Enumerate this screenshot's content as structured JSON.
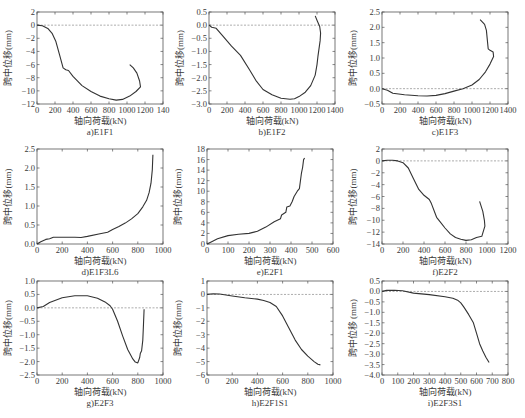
{
  "figure": {
    "ylabel": "跨中位移(mm)",
    "ylabel_alt": "跨中位移 (mm)",
    "xlabel": "轴向荷载(kN)"
  },
  "chart_data": [
    {
      "id": "a",
      "type": "line",
      "caption": "a)E1F1",
      "xlabel": "轴向荷载(kN)",
      "ylabel": "跨中位移(mm)",
      "xlim": [
        0,
        1400
      ],
      "ylim": [
        -12,
        2
      ],
      "xticks": [
        0,
        200,
        400,
        600,
        800,
        1000,
        1200,
        1400
      ],
      "xtick_labels": [
        "0",
        "200",
        "400",
        "600",
        "800",
        "1000",
        "1200",
        "140"
      ],
      "yticks": [
        2,
        0,
        -2,
        -4,
        -6,
        -8,
        -10,
        -12
      ],
      "zero_line": true,
      "box": [
        37,
        12,
        163,
        104
      ],
      "series": [
        {
          "name": "E1F1",
          "x": [
            0,
            60,
            120,
            170,
            210,
            250,
            290,
            320,
            350,
            400,
            500,
            600,
            700,
            800,
            880,
            950,
            1030,
            1100,
            1150,
            1140,
            1110,
            1070,
            1030
          ],
          "y": [
            0,
            -0.1,
            -0.5,
            -1.3,
            -2.5,
            -4.5,
            -6.5,
            -6.8,
            -6.9,
            -7.8,
            -9.2,
            -10.1,
            -10.8,
            -11.2,
            -11.4,
            -11.3,
            -10.8,
            -10.1,
            -9.4,
            -8.5,
            -7.3,
            -6.5,
            -6.0
          ]
        }
      ]
    },
    {
      "id": "b",
      "type": "line",
      "caption": "b)E1F2",
      "xlabel": "轴向荷载(kN)",
      "ylabel": "跨中位移(mm)",
      "xlim": [
        0,
        1400
      ],
      "ylim": [
        -3.0,
        0.5
      ],
      "xticks": [
        0,
        200,
        400,
        600,
        800,
        1000,
        1200,
        1400
      ],
      "xtick_labels": [
        "0",
        "200",
        "400",
        "600",
        "800",
        "1000",
        "1200",
        "1400"
      ],
      "yticks": [
        0.5,
        0.0,
        -0.5,
        -1.0,
        -1.5,
        -2.0,
        -2.5,
        -3.0
      ],
      "zero_line": true,
      "box": [
        209,
        12,
        335,
        104
      ],
      "series": [
        {
          "name": "E1F2",
          "x": [
            0,
            30,
            80,
            150,
            250,
            350,
            450,
            520,
            600,
            700,
            800,
            900,
            950,
            1000,
            1070,
            1130,
            1180,
            1200,
            1210,
            1235,
            1240,
            1230,
            1205,
            1180
          ],
          "y": [
            0,
            -0.08,
            -0.12,
            -0.4,
            -0.8,
            -1.15,
            -1.7,
            -2.1,
            -2.45,
            -2.65,
            -2.78,
            -2.82,
            -2.8,
            -2.72,
            -2.55,
            -2.3,
            -1.9,
            -1.5,
            -1.2,
            -0.6,
            -0.3,
            -0.05,
            0.15,
            0.35
          ]
        }
      ]
    },
    {
      "id": "c",
      "type": "line",
      "caption": "c)E1F3",
      "xlabel": "轴向荷载(kN)",
      "ylabel": "跨中位移(mm)",
      "xlim": [
        0,
        1400
      ],
      "ylim": [
        -0.5,
        2.5
      ],
      "xticks": [
        0,
        200,
        400,
        600,
        800,
        1000,
        1200,
        1400
      ],
      "xtick_labels": [
        "0",
        "200",
        "400",
        "600",
        "800",
        "1000",
        "1200",
        "1400"
      ],
      "yticks": [
        2.5,
        2.0,
        1.5,
        1.0,
        0.5,
        0.0,
        -0.5
      ],
      "zero_line": true,
      "box": [
        382,
        12,
        508,
        104
      ],
      "series": [
        {
          "name": "E1F3",
          "x": [
            0,
            60,
            120,
            250,
            400,
            500,
            600,
            700,
            800,
            900,
            1000,
            1080,
            1150,
            1200,
            1240,
            1235,
            1200,
            1180,
            1170,
            1160,
            1140,
            1090
          ],
          "y": [
            0,
            -0.05,
            -0.15,
            -0.2,
            -0.23,
            -0.24,
            -0.22,
            -0.16,
            -0.08,
            0.0,
            0.12,
            0.3,
            0.55,
            0.8,
            1.05,
            1.2,
            1.25,
            1.3,
            1.6,
            1.9,
            2.1,
            2.25
          ]
        }
      ]
    },
    {
      "id": "d",
      "type": "line",
      "caption": "d)E1F3L6",
      "xlabel": "轴向荷载(kN)",
      "ylabel": "跨中位移(mm)",
      "xlim": [
        0,
        1000
      ],
      "ylim": [
        0.0,
        2.5
      ],
      "xticks": [
        0,
        200,
        400,
        600,
        800,
        1000
      ],
      "xtick_labels": [
        "0",
        "200",
        "400",
        "600",
        "800",
        "1000"
      ],
      "yticks": [
        2.5,
        2.0,
        1.5,
        1.0,
        0.5,
        0.0
      ],
      "zero_line": false,
      "box": [
        37,
        149,
        163,
        244
      ],
      "series": [
        {
          "name": "E1F3L6",
          "x": [
            0,
            30,
            70,
            100,
            130,
            200,
            300,
            350,
            400,
            500,
            560,
            600,
            650,
            700,
            750,
            800,
            840,
            870,
            890,
            905,
            915,
            920
          ],
          "y": [
            0,
            0.06,
            0.12,
            0.14,
            0.18,
            0.18,
            0.18,
            0.17,
            0.2,
            0.27,
            0.31,
            0.38,
            0.46,
            0.55,
            0.66,
            0.8,
            0.98,
            1.15,
            1.35,
            1.6,
            1.95,
            2.35
          ]
        }
      ]
    },
    {
      "id": "e",
      "type": "line",
      "caption": "e)E2F1",
      "xlabel": "轴向荷载(kN)",
      "ylabel": "跨中位移(mm)",
      "xlim": [
        0,
        600
      ],
      "ylim": [
        0,
        18
      ],
      "xticks": [
        0,
        100,
        200,
        300,
        400,
        500,
        600
      ],
      "xtick_labels": [
        "0",
        "100",
        "200",
        "300",
        "400",
        "500",
        "600"
      ],
      "yticks": [
        18,
        16,
        14,
        12,
        10,
        8,
        6,
        4,
        2,
        0
      ],
      "zero_line": false,
      "box": [
        207,
        149,
        333,
        244
      ],
      "series": [
        {
          "name": "E2F1",
          "x": [
            0,
            20,
            50,
            100,
            150,
            200,
            240,
            280,
            320,
            350,
            355,
            375,
            380,
            395,
            405,
            415,
            430,
            440,
            450,
            455,
            460,
            465
          ],
          "y": [
            0,
            0.4,
            1.0,
            1.6,
            1.85,
            2.0,
            2.4,
            3.2,
            4.2,
            4.8,
            5.5,
            6.0,
            7.0,
            7.2,
            8.0,
            9.0,
            10.0,
            10.5,
            13.5,
            14.5,
            16.0,
            16.3
          ]
        }
      ]
    },
    {
      "id": "f",
      "type": "line",
      "caption": "f)E2F2",
      "xlabel": "轴向荷载(kN)",
      "ylabel": "跨中位移(mm)",
      "xlim": [
        0,
        1200
      ],
      "ylim": [
        -14,
        2
      ],
      "xticks": [
        0,
        200,
        400,
        600,
        800,
        1000,
        1200
      ],
      "xtick_labels": [
        "0",
        "200",
        "400",
        "600",
        "800",
        "1000",
        "1200"
      ],
      "yticks": [
        2,
        0,
        -2,
        -4,
        -6,
        -8,
        -10,
        -12,
        -14
      ],
      "zero_line": true,
      "box": [
        382,
        149,
        508,
        244
      ],
      "series": [
        {
          "name": "E2F2",
          "x": [
            0,
            50,
            100,
            150,
            200,
            250,
            300,
            350,
            400,
            450,
            470,
            520,
            550,
            600,
            650,
            700,
            750,
            800,
            850,
            900,
            950,
            980,
            975,
            960,
            930
          ],
          "y": [
            0,
            0.1,
            0.1,
            0.0,
            -0.3,
            -1.2,
            -3.0,
            -4.8,
            -5.8,
            -6.5,
            -7.2,
            -9.5,
            -10.2,
            -11.3,
            -12.3,
            -12.9,
            -13.2,
            -13.4,
            -13.3,
            -12.9,
            -12.7,
            -11.0,
            -10.0,
            -8.5,
            -6.8
          ]
        }
      ]
    },
    {
      "id": "g",
      "type": "line",
      "caption": "g)E2F3",
      "xlabel": "轴向荷载(kN)",
      "ylabel": "跨中位移(mm)",
      "xlim": [
        0,
        1000
      ],
      "ylim": [
        -2.5,
        1.0
      ],
      "xticks": [
        0,
        200,
        400,
        600,
        800,
        1000
      ],
      "xtick_labels": [
        "0",
        "200",
        "400",
        "600",
        "800",
        "1000"
      ],
      "yticks": [
        1.0,
        0.5,
        0.0,
        -0.5,
        -1.0,
        -1.5,
        -2.0,
        -2.5
      ],
      "zero_line": true,
      "box": [
        37,
        281,
        163,
        375
      ],
      "series": [
        {
          "name": "E2F3",
          "x": [
            0,
            50,
            100,
            200,
            300,
            400,
            480,
            540,
            580,
            600,
            640,
            680,
            720,
            760,
            780,
            800,
            815,
            820,
            830,
            840,
            845,
            850
          ],
          "y": [
            0,
            0.05,
            0.2,
            0.38,
            0.45,
            0.45,
            0.36,
            0.22,
            0.08,
            -0.05,
            -0.5,
            -1.05,
            -1.55,
            -1.9,
            -2.02,
            -2.05,
            -1.85,
            -1.7,
            -1.6,
            -1.2,
            -0.6,
            -0.05
          ]
        }
      ]
    },
    {
      "id": "h",
      "type": "line",
      "caption": "h)E2F1S1",
      "xlabel": "轴向荷载(kN)",
      "ylabel": "跨中位移(mm)",
      "xlim": [
        0,
        1000
      ],
      "ylim": [
        -6,
        1
      ],
      "xticks": [
        0,
        200,
        400,
        600,
        800,
        1000
      ],
      "xtick_labels": [
        "0",
        "200",
        "400",
        "600",
        "800",
        "1000"
      ],
      "yticks": [
        1,
        0,
        -1,
        -2,
        -3,
        -4,
        -5,
        -6
      ],
      "zero_line": true,
      "box": [
        207,
        281,
        333,
        375
      ],
      "series": [
        {
          "name": "E2F1S1",
          "x": [
            0,
            50,
            100,
            200,
            300,
            400,
            450,
            500,
            550,
            600,
            650,
            700,
            750,
            800,
            850,
            880,
            900
          ],
          "y": [
            0,
            0.05,
            0.03,
            -0.12,
            -0.25,
            -0.35,
            -0.45,
            -0.6,
            -0.9,
            -1.6,
            -2.5,
            -3.4,
            -4.1,
            -4.6,
            -5.0,
            -5.2,
            -5.25
          ]
        }
      ]
    },
    {
      "id": "i",
      "type": "line",
      "caption": "i)E2F3S1",
      "xlabel": "轴向荷载(kN)",
      "ylabel": "跨中位移 (mm)",
      "xlim": [
        0,
        800
      ],
      "ylim": [
        -4.0,
        0.5
      ],
      "xticks": [
        0,
        100,
        200,
        300,
        400,
        500,
        600,
        700,
        800
      ],
      "xtick_labels": [
        "0",
        "100",
        "200",
        "300",
        "400",
        "500",
        "600",
        "700",
        "800"
      ],
      "yticks": [
        0.5,
        0.0,
        -0.5,
        -1.0,
        -1.5,
        -2.0,
        -2.5,
        -3.0,
        -3.5,
        -4.0
      ],
      "zero_line": true,
      "box": [
        382,
        281,
        508,
        375
      ],
      "series": [
        {
          "name": "E2F3S1",
          "x": [
            0,
            30,
            80,
            130,
            200,
            300,
            400,
            450,
            480,
            500,
            520,
            550,
            580,
            600,
            620,
            640,
            660,
            680
          ],
          "y": [
            0,
            0.05,
            0.06,
            0.03,
            -0.08,
            -0.15,
            -0.25,
            -0.33,
            -0.42,
            -0.55,
            -0.75,
            -1.1,
            -1.5,
            -2.0,
            -2.5,
            -2.85,
            -3.15,
            -3.4
          ]
        }
      ]
    }
  ]
}
